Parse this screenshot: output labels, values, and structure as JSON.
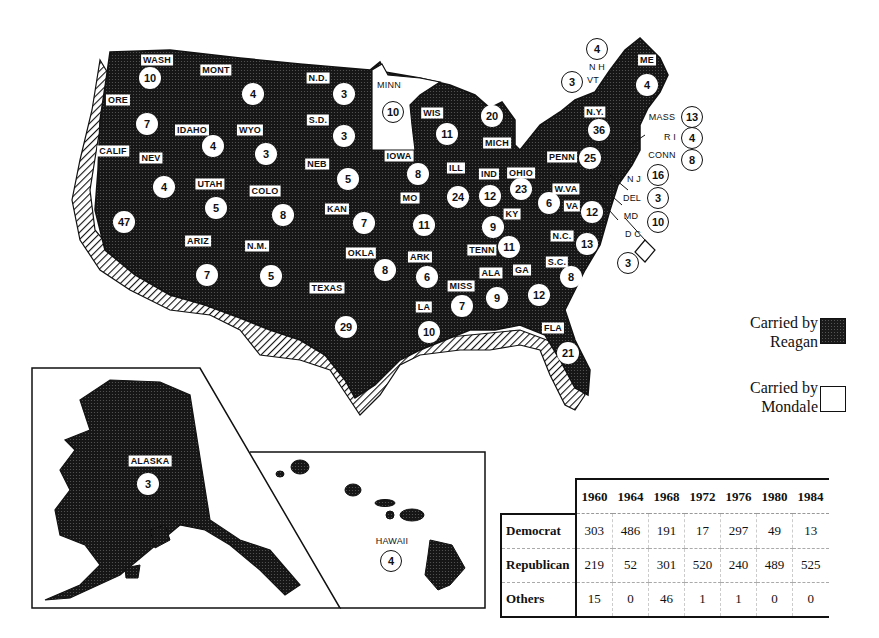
{
  "legend": {
    "reagan": {
      "line1": "Carried by",
      "line2": "Reagan",
      "color": "#1a1a1a"
    },
    "mondale": {
      "line1": "Carried by",
      "line2": "Mondale",
      "color": "#ffffff"
    }
  },
  "states": [
    {
      "abbr": "WASH",
      "ev": "10",
      "carried": "Reagan"
    },
    {
      "abbr": "MONT",
      "ev": "4",
      "carried": "Reagan"
    },
    {
      "abbr": "N.D.",
      "ev": "3",
      "carried": "Reagan"
    },
    {
      "abbr": "MINN",
      "ev": "10",
      "carried": "Mondale"
    },
    {
      "abbr": "ORE",
      "ev": "7",
      "carried": "Reagan"
    },
    {
      "abbr": "IDAHO",
      "ev": "4",
      "carried": "Reagan"
    },
    {
      "abbr": "WYO",
      "ev": "3",
      "carried": "Reagan"
    },
    {
      "abbr": "S.D.",
      "ev": "3",
      "carried": "Reagan"
    },
    {
      "abbr": "WIS",
      "ev": "11",
      "carried": "Reagan"
    },
    {
      "abbr": "MICH",
      "ev": "20",
      "carried": "Reagan"
    },
    {
      "abbr": "CALIF",
      "ev": "47",
      "carried": "Reagan"
    },
    {
      "abbr": "NEV",
      "ev": "4",
      "carried": "Reagan"
    },
    {
      "abbr": "UTAH",
      "ev": "5",
      "carried": "Reagan"
    },
    {
      "abbr": "COLO",
      "ev": "8",
      "carried": "Reagan"
    },
    {
      "abbr": "NEB",
      "ev": "5",
      "carried": "Reagan"
    },
    {
      "abbr": "IOWA",
      "ev": "8",
      "carried": "Reagan"
    },
    {
      "abbr": "ILL",
      "ev": "24",
      "carried": "Reagan"
    },
    {
      "abbr": "IND",
      "ev": "12",
      "carried": "Reagan"
    },
    {
      "abbr": "OHIO",
      "ev": "23",
      "carried": "Reagan"
    },
    {
      "abbr": "PENN",
      "ev": "25",
      "carried": "Reagan"
    },
    {
      "abbr": "N.Y.",
      "ev": "36",
      "carried": "Reagan"
    },
    {
      "abbr": "ME",
      "ev": "4",
      "carried": "Reagan"
    },
    {
      "abbr": "N H",
      "ev": "4",
      "carried": "Reagan"
    },
    {
      "abbr": "VT",
      "ev": "3",
      "carried": "Reagan"
    },
    {
      "abbr": "MASS",
      "ev": "13",
      "carried": "Reagan"
    },
    {
      "abbr": "R I",
      "ev": "4",
      "carried": "Reagan"
    },
    {
      "abbr": "CONN",
      "ev": "8",
      "carried": "Reagan"
    },
    {
      "abbr": "N J",
      "ev": "16",
      "carried": "Reagan"
    },
    {
      "abbr": "DEL",
      "ev": "3",
      "carried": "Reagan"
    },
    {
      "abbr": "MD",
      "ev": "10",
      "carried": "Reagan"
    },
    {
      "abbr": "D C",
      "ev": "3",
      "carried": "Mondale"
    },
    {
      "abbr": "KAN",
      "ev": "7",
      "carried": "Reagan"
    },
    {
      "abbr": "MO",
      "ev": "11",
      "carried": "Reagan"
    },
    {
      "abbr": "KY",
      "ev": "9",
      "carried": "Reagan"
    },
    {
      "abbr": "W.VA",
      "ev": "6",
      "carried": "Reagan"
    },
    {
      "abbr": "VA",
      "ev": "12",
      "carried": "Reagan"
    },
    {
      "abbr": "ARIZ",
      "ev": "7",
      "carried": "Reagan"
    },
    {
      "abbr": "N.M.",
      "ev": "5",
      "carried": "Reagan"
    },
    {
      "abbr": "OKLA",
      "ev": "8",
      "carried": "Reagan"
    },
    {
      "abbr": "ARK",
      "ev": "6",
      "carried": "Reagan"
    },
    {
      "abbr": "TENN",
      "ev": "11",
      "carried": "Reagan"
    },
    {
      "abbr": "N.C.",
      "ev": "13",
      "carried": "Reagan"
    },
    {
      "abbr": "S.C.",
      "ev": "8",
      "carried": "Reagan"
    },
    {
      "abbr": "TEXAS",
      "ev": "29",
      "carried": "Reagan"
    },
    {
      "abbr": "MISS",
      "ev": "7",
      "carried": "Reagan"
    },
    {
      "abbr": "ALA",
      "ev": "9",
      "carried": "Reagan"
    },
    {
      "abbr": "GA",
      "ev": "12",
      "carried": "Reagan"
    },
    {
      "abbr": "LA",
      "ev": "10",
      "carried": "Reagan"
    },
    {
      "abbr": "FLA",
      "ev": "21",
      "carried": "Reagan"
    },
    {
      "abbr": "ALASKA",
      "ev": "3",
      "carried": "Reagan"
    },
    {
      "abbr": "HAWAII",
      "ev": "4",
      "carried": "Reagan"
    }
  ],
  "table": {
    "years": [
      "1960",
      "1964",
      "1968",
      "1972",
      "1976",
      "1980",
      "1984"
    ],
    "rows": [
      {
        "party": "Democrat",
        "values": [
          "303",
          "486",
          "191",
          "17",
          "297",
          "49",
          "13"
        ]
      },
      {
        "party": "Republican",
        "values": [
          "219",
          "52",
          "301",
          "520",
          "240",
          "489",
          "525"
        ]
      },
      {
        "party": "Others",
        "values": [
          "15",
          "0",
          "46",
          "1",
          "1",
          "0",
          "0"
        ]
      }
    ]
  }
}
